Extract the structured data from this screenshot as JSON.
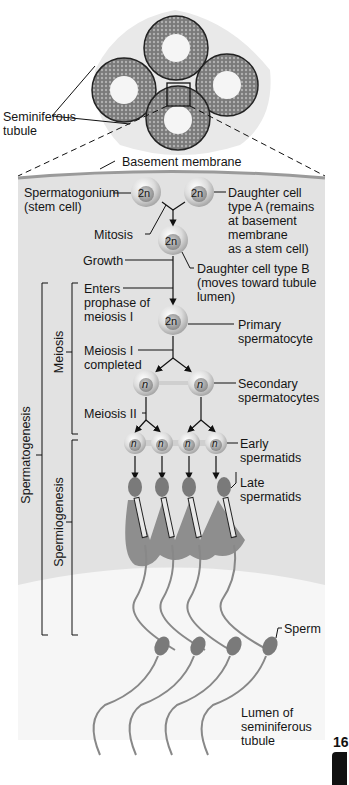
{
  "figure": {
    "overview_label": "Seminiferous\ntubule",
    "basement_membrane": "Basement membrane",
    "page_tab": "16"
  },
  "cells": {
    "diploid": "2n",
    "haploid": "n"
  },
  "labels": {
    "spermatogonium": "Spermatogonium\n(stem cell)",
    "daughter_a": "Daughter cell\ntype A (remains\nat basement\nmembrane\nas a stem cell)",
    "mitosis": "Mitosis",
    "growth": "Growth",
    "daughter_b": "Daughter cell type B\n(moves toward tubule\nlumen)",
    "enters_prophase": "Enters\nprophase of\nmeiosis I",
    "primary": "Primary\nspermatocyte",
    "meiosis1_completed": "Meiosis I\ncompleted",
    "secondary": "Secondary\nspermatocytes",
    "meiosis2": "Meiosis II",
    "early_spermatids": "Early\nspermatids",
    "late_spermatids": "Late\nspermatids",
    "sperm": "Sperm",
    "lumen": "Lumen of\nseminiferous\ntubule"
  },
  "brackets": {
    "spermatogenesis": "Spermatogenesis",
    "meiosis": "Meiosis",
    "spermiogenesis": "Spermiogenesis"
  },
  "colors": {
    "panel_bg": "#e4e4e4",
    "lumen_bg": "#f4f4f4",
    "cell_fill": "#d8d8d8",
    "tissue_fill": "#8c8c8c",
    "line": "#111111"
  }
}
